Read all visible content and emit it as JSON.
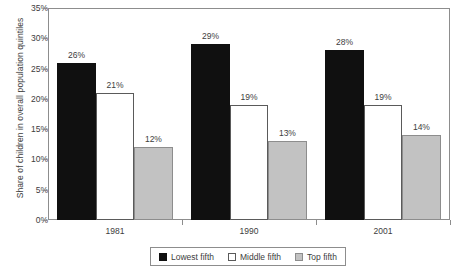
{
  "chart_data": {
    "type": "bar",
    "title": "",
    "subtitle": "",
    "xlabel": "",
    "ylabel": "Share of children in overall population quintiles",
    "categories": [
      "1981",
      "1990",
      "2001"
    ],
    "series": [
      {
        "name": "Lowest fifth",
        "values": [
          26,
          29,
          28
        ],
        "labels": [
          "26%",
          "29%",
          "28%"
        ],
        "color": "#101010"
      },
      {
        "name": "Middle fifth",
        "values": [
          21,
          19,
          19
        ],
        "labels": [
          "21%",
          "19%",
          "19%"
        ],
        "color": "#ffffff"
      },
      {
        "name": "Top fifth",
        "values": [
          12,
          13,
          14
        ],
        "labels": [
          "12%",
          "13%",
          "14%"
        ],
        "color": "#c2c2c2"
      }
    ],
    "ylim": [
      0,
      35
    ],
    "ytick_values": [
      0,
      5,
      10,
      15,
      20,
      25,
      30,
      35
    ],
    "ytick_labels": [
      "0%",
      "5%",
      "10%",
      "15%",
      "20%",
      "25%",
      "30%",
      "35%"
    ],
    "grid": false,
    "legend_position": "bottom",
    "value_labels_shown": true
  },
  "legend": {
    "items": [
      {
        "label": "Lowest fifth"
      },
      {
        "label": "Middle fifth"
      },
      {
        "label": "Top fifth"
      }
    ]
  }
}
